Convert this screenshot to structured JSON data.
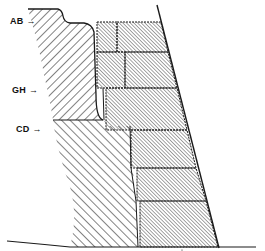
{
  "figure": {
    "type": "cross-section diagram",
    "labels": [
      {
        "id": "AB",
        "text": "AB",
        "arrow": "→"
      },
      {
        "id": "GH",
        "text": "GH",
        "arrow": "→"
      },
      {
        "id": "CD",
        "text": "CD",
        "arrow": "→"
      }
    ],
    "colors": {
      "ink": "#1a1a1a",
      "background": "#ffffff",
      "block_fill": "#d9d9d9"
    },
    "blocks": [
      {
        "row": 1,
        "count": 2
      },
      {
        "row": 2,
        "count": 2
      },
      {
        "row": 3,
        "count": 1
      },
      {
        "row": 4,
        "count": 1
      },
      {
        "row": 5,
        "count": 1
      },
      {
        "row": 6,
        "count": 1
      }
    ]
  }
}
